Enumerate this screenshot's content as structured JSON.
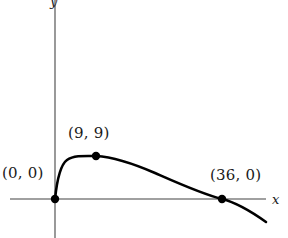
{
  "figure": {
    "kind": "cartesian-plot",
    "background_color": "#ffffff",
    "axis_color": "#808080",
    "curve_color": "#000000",
    "point_color": "#000000",
    "text_color": "#1a1a1a"
  },
  "axes": {
    "x_label": "x",
    "y_label": "y",
    "origin_px": {
      "x": 55,
      "y": 199
    },
    "x_axis_px": {
      "x1": 10,
      "x2": 266,
      "y": 199
    },
    "y_axis_px": {
      "x": 55,
      "y1": 0,
      "y2": 238
    }
  },
  "labels": {
    "origin": "(0, 0)",
    "peak": "(9, 9)",
    "x_intercept": "(36, 0)"
  },
  "chart_data": {
    "type": "line",
    "title": "",
    "xlabel": "x",
    "ylabel": "y",
    "grid": false,
    "legend": null,
    "xlim": [
      -10,
      49
    ],
    "ylim": [
      -5,
      45
    ],
    "annotations": [
      {
        "label": "(0, 0)",
        "x": 0,
        "y": 0
      },
      {
        "label": "(9, 9)",
        "x": 9,
        "y": 9
      },
      {
        "label": "(36, 0)",
        "x": 36,
        "y": 0
      }
    ],
    "marked_points": [
      {
        "x": 0,
        "y": 0
      },
      {
        "x": 9,
        "y": 9
      },
      {
        "x": 36,
        "y": 0
      }
    ],
    "series": [
      {
        "name": "curve",
        "x": [
          0,
          0.5,
          1,
          2,
          3,
          4,
          5,
          6,
          7,
          8,
          9,
          10,
          12,
          14,
          16,
          18,
          20,
          22,
          24,
          26,
          28,
          30,
          32,
          34,
          36,
          38,
          40,
          42,
          44,
          46,
          48
        ],
        "y": [
          0,
          5.0,
          6.5,
          8.0,
          8.6,
          9.0,
          9.0,
          9.0,
          8.9,
          8.7,
          9.0,
          8.7,
          8.3,
          7.8,
          7.2,
          6.6,
          5.9,
          5.2,
          4.5,
          3.7,
          2.9,
          2.1,
          1.3,
          0.6,
          0.0,
          -1.1,
          -1.9,
          -2.8,
          -3.6,
          -4.4,
          -5.2
        ]
      }
    ]
  },
  "curve_path": "M 55,199 C 57,180 60,165 67,160 C 74,155 86,156 96,156 C 112,157 132,163 155,173 C 180,184 202,194 222,199 C 238,203 252,212 266,222",
  "points_px": [
    {
      "name": "origin-point",
      "x": 55,
      "y": 199,
      "r": 4.2
    },
    {
      "name": "peak-point",
      "x": 96,
      "y": 156,
      "r": 4.2
    },
    {
      "name": "x-intercept-point",
      "x": 222,
      "y": 199,
      "r": 4.2
    }
  ]
}
